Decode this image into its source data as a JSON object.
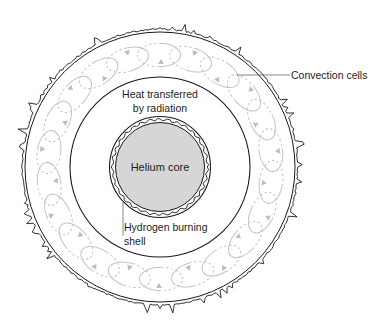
{
  "diagram": {
    "labels": {
      "convection": "Convection cells",
      "radiation_line1": "Heat transferred",
      "radiation_line2": "by radiation",
      "core": "Helium core",
      "shell_line1": "Hydrogen burning",
      "shell_line2": "shell"
    },
    "layers": [
      {
        "name": "helium-core",
        "label": "Helium core"
      },
      {
        "name": "hydrogen-burning-shell",
        "label": "Hydrogen burning shell"
      },
      {
        "name": "radiative-zone",
        "label": "Heat transferred by radiation"
      },
      {
        "name": "convective-envelope",
        "label": "Convection cells"
      }
    ],
    "convection_cell_count": 22,
    "colors": {
      "core_fill": "#d6d6d6",
      "outline": "#1a1a1a",
      "convection_cell": "#c4c4c4",
      "background": "#ffffff"
    }
  }
}
